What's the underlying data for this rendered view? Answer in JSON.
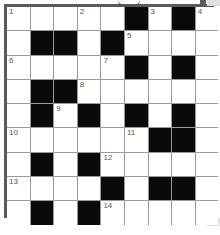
{
  "puzzle": {
    "rows": 9,
    "cols": 9,
    "grid": [
      [
        "1",
        "",
        "",
        "2",
        "",
        "#",
        "3",
        "#",
        "4"
      ],
      [
        "",
        "#",
        "#",
        "",
        "#",
        "5",
        "",
        "",
        ""
      ],
      [
        "6",
        "",
        "",
        "",
        "7",
        "#",
        "",
        "#",
        ""
      ],
      [
        "",
        "#",
        "#",
        "8",
        "",
        "",
        "",
        "",
        ""
      ],
      [
        "",
        "#",
        "9",
        "#",
        "",
        "#",
        "",
        "#",
        ""
      ],
      [
        "10",
        "",
        "",
        "",
        "",
        "11",
        "#",
        "#",
        ""
      ],
      [
        "",
        "#",
        "",
        "#",
        "12",
        "",
        "",
        "",
        ""
      ],
      [
        "13",
        "",
        "",
        "",
        "#",
        "",
        "#",
        "#",
        ""
      ],
      [
        "",
        "#",
        "",
        "#",
        "14",
        "",
        "",
        "",
        ""
      ]
    ],
    "clue_numbers": [
      "1",
      "2",
      "3",
      "4",
      "5",
      "6",
      "7",
      "8",
      "9",
      "10",
      "11",
      "12",
      "13",
      "14"
    ],
    "colors": {
      "block": "#0a0a0a",
      "cell": "#ffffff",
      "gridline": "#9a9a9a",
      "border": "#5a5a5a",
      "number": "#555555"
    }
  }
}
